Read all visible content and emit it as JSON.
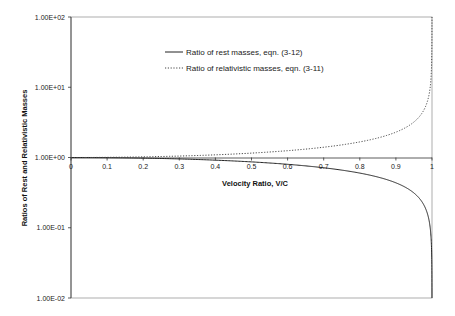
{
  "chart_data": {
    "type": "line",
    "title": "",
    "xlabel": "Velocity Ratio, V/C",
    "ylabel": "Ratios of Rest and Relativistic Masses",
    "xlim": [
      0,
      1
    ],
    "ylim": [
      0.01,
      100
    ],
    "yscale": "log",
    "x_ticks": [
      "0",
      "0.1",
      "0.2",
      "0.3",
      "0.4",
      "0.5",
      "0.6",
      "0.7",
      "0.8",
      "0.9",
      "1"
    ],
    "y_ticks": [
      "1.00E+02",
      "1.00E+01",
      "1.00E+00",
      "1.00E-01",
      "1.00E-02"
    ],
    "grid": false,
    "legend_position": "upper center",
    "x": [
      0,
      0.1,
      0.2,
      0.3,
      0.4,
      0.5,
      0.6,
      0.7,
      0.8,
      0.9,
      0.95,
      0.99,
      0.999,
      0.9999
    ],
    "series": [
      {
        "name": "Ratio of rest masses, eqn. (3-12)",
        "style": "solid",
        "values": [
          1.0,
          0.995,
          0.98,
          0.954,
          0.917,
          0.866,
          0.8,
          0.714,
          0.6,
          0.436,
          0.312,
          0.141,
          0.0447,
          0.0141
        ]
      },
      {
        "name": "Ratio of relativistic masses, eqn. (3-11)",
        "style": "dotted",
        "values": [
          1.0,
          1.005,
          1.021,
          1.048,
          1.091,
          1.155,
          1.25,
          1.4,
          1.667,
          2.294,
          3.203,
          7.089,
          22.37,
          70.71
        ]
      }
    ]
  }
}
